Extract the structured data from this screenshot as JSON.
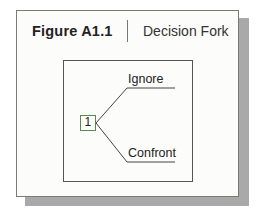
{
  "figure": {
    "label": "Figure A1.1",
    "title": "Decision Fork"
  },
  "diagram": {
    "node": {
      "label": "1",
      "type": "decision"
    },
    "branches": [
      {
        "label": "Ignore"
      },
      {
        "label": "Confront"
      }
    ],
    "colors": {
      "line": "#444444",
      "node_border": "#5a8a4a"
    }
  }
}
